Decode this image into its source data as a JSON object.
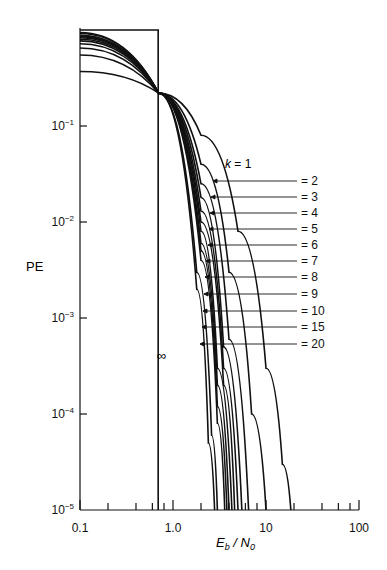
{
  "chart_data": {
    "type": "line",
    "title": "",
    "xlabel": "E_b / N_0",
    "ylabel": "PE",
    "xscale": "log",
    "yscale": "log",
    "xlim": [
      0.1,
      100
    ],
    "ylim": [
      1e-05,
      1
    ],
    "x_tick_labels": [
      "0.1",
      "1.0",
      "10",
      "100"
    ],
    "y_tick_labels": [
      "10^-1",
      "10^-2",
      "10^-3",
      "10^-4",
      "10^-5"
    ],
    "grid": false,
    "annotation_infinity": "∞",
    "infinity_limit_x": 0.693,
    "series_labels": [
      "k = 1",
      "= 2",
      "= 3",
      "= 4",
      "= 5",
      "= 6",
      "= 7",
      "= 8",
      "= 9",
      "= 10",
      "= 15",
      "= 20"
    ],
    "series": [
      {
        "name": "k=1",
        "x": [
          0.1,
          0.7,
          2,
          5,
          10,
          15,
          18.5
        ],
        "y": [
          0.37,
          0.22,
          0.08,
          0.008,
          0.0003,
          3e-05,
          1e-05
        ]
      },
      {
        "name": "k=2",
        "x": [
          0.1,
          0.7,
          2,
          4,
          7,
          10
        ],
        "y": [
          0.55,
          0.22,
          0.04,
          0.003,
          0.0001,
          1e-05
        ]
      },
      {
        "name": "k=3",
        "x": [
          0.1,
          0.7,
          2,
          4,
          6.5
        ],
        "y": [
          0.65,
          0.22,
          0.025,
          0.0006,
          1e-05
        ]
      },
      {
        "name": "k=4",
        "x": [
          0.1,
          0.7,
          2,
          3.5,
          5.5
        ],
        "y": [
          0.72,
          0.22,
          0.018,
          0.0005,
          1e-05
        ]
      },
      {
        "name": "k=5",
        "x": [
          0.1,
          0.7,
          2,
          3.5,
          5
        ],
        "y": [
          0.77,
          0.22,
          0.013,
          0.0003,
          1e-05
        ]
      },
      {
        "name": "k=6",
        "x": [
          0.1,
          0.7,
          2,
          3.5,
          4.6
        ],
        "y": [
          0.8,
          0.22,
          0.01,
          0.0002,
          1e-05
        ]
      },
      {
        "name": "k=7",
        "x": [
          0.1,
          0.7,
          2,
          3,
          4.3
        ],
        "y": [
          0.83,
          0.22,
          0.008,
          0.0003,
          1e-05
        ]
      },
      {
        "name": "k=8",
        "x": [
          0.1,
          0.7,
          2,
          3,
          4
        ],
        "y": [
          0.85,
          0.22,
          0.006,
          0.0002,
          1e-05
        ]
      },
      {
        "name": "k=9",
        "x": [
          0.1,
          0.7,
          2,
          3,
          3.8
        ],
        "y": [
          0.87,
          0.22,
          0.005,
          0.00012,
          1e-05
        ]
      },
      {
        "name": "k=10",
        "x": [
          0.1,
          0.7,
          2,
          3,
          3.6
        ],
        "y": [
          0.88,
          0.22,
          0.004,
          8e-05,
          1e-05
        ]
      },
      {
        "name": "k=15",
        "x": [
          0.1,
          0.7,
          1.8,
          2.6,
          3.0
        ],
        "y": [
          0.92,
          0.22,
          0.003,
          6e-05,
          1e-05
        ]
      },
      {
        "name": "k=20",
        "x": [
          0.1,
          0.7,
          1.8,
          2.4,
          2.8
        ],
        "y": [
          0.94,
          0.22,
          0.002,
          5e-05,
          1e-05
        ]
      },
      {
        "name": "k=inf",
        "x": [
          0.1,
          0.693,
          0.693
        ],
        "y": [
          1.0,
          1.0,
          1e-05
        ]
      }
    ]
  },
  "labels": {
    "ylabel": "PE",
    "xlabel_main": "E",
    "xlabel_sub1": "b",
    "xlabel_slash": " / N",
    "xlabel_sub2": "0",
    "infinity": "∞",
    "k1": "k = 1"
  }
}
